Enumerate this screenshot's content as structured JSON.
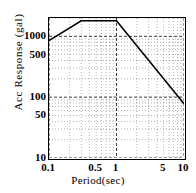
{
  "chart_data": {
    "type": "line",
    "title": "",
    "xlabel": "Period(sec)",
    "ylabel": "Acc Response (gal)",
    "xscale": "log",
    "yscale": "log",
    "xlim": [
      0.1,
      10
    ],
    "ylim": [
      10,
      2000
    ],
    "grid": true,
    "grid_style": "dotted-minor-log",
    "legend": "none",
    "xticks": [
      {
        "value": 0.1,
        "label": "0.1"
      },
      {
        "value": 0.5,
        "label": "0.5"
      },
      {
        "value": 1,
        "label": "1"
      },
      {
        "value": 5,
        "label": "5"
      },
      {
        "value": 10,
        "label": "10"
      }
    ],
    "yticks": [
      {
        "value": 1000,
        "label": "1000"
      },
      {
        "value": 500,
        "label": "500"
      },
      {
        "value": 100,
        "label": "100"
      },
      {
        "value": 50,
        "label": "50"
      },
      {
        "value": 10,
        "label": "10"
      }
    ],
    "series": [
      {
        "name": "Acc Response Spectrum",
        "color": "#000000",
        "x": [
          0.1,
          0.3,
          1.0,
          10.0
        ],
        "y": [
          850,
          1800,
          1800,
          78
        ]
      }
    ],
    "annotations": []
  },
  "axis": {
    "y_title": "Acc Response (gal)",
    "x_title": "Period(sec)"
  }
}
